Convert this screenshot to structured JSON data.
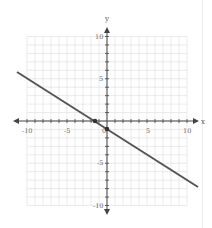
{
  "chart_data": {
    "type": "line",
    "title": "",
    "xlabel": "x",
    "ylabel": "y",
    "xlim": [
      -10,
      10
    ],
    "ylim": [
      -10,
      10
    ],
    "grid": true,
    "x_ticks": [
      "-10",
      "-5",
      "0",
      "5",
      "10"
    ],
    "y_ticks": [
      "10",
      "5",
      "-5",
      "-10"
    ],
    "series": [
      {
        "name": "line",
        "equation": "y = -2/3 x - 1",
        "x": [
          -11.25,
          11.25
        ],
        "y": [
          6.5,
          -8.5
        ]
      }
    ],
    "points": [
      {
        "x": -1.5,
        "y": 0
      },
      {
        "x": 0,
        "y": -1
      }
    ],
    "colors": {
      "line": "#555555",
      "grid": "#d8d8d8",
      "axis": "#444444"
    }
  },
  "labels": {
    "x_axis": "x",
    "y_axis": "y",
    "tick_x_m10": "-10",
    "tick_x_m5": "-5",
    "tick_x_0": "0",
    "tick_x_5": "5",
    "tick_x_10": "10",
    "tick_y_10": "10",
    "tick_y_5": "5",
    "tick_y_m5": "-5",
    "tick_y_m10": "-10"
  }
}
